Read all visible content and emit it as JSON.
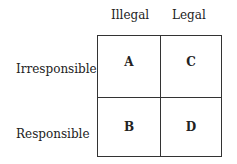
{
  "columns": [
    {
      "label": "Illegal"
    },
    {
      "label": "Legal"
    }
  ],
  "rows": [
    {
      "label": "Irresponsible"
    },
    {
      "label": "Responsible"
    }
  ],
  "cells": [
    {
      "row": 0,
      "col": 0,
      "label": "A"
    },
    {
      "row": 0,
      "col": 1,
      "label": "C"
    },
    {
      "row": 1,
      "col": 0,
      "label": "B"
    },
    {
      "row": 1,
      "col": 1,
      "label": "D"
    }
  ],
  "colors": {
    "line": "#333333",
    "text": "#222222",
    "background": "#ffffff"
  }
}
